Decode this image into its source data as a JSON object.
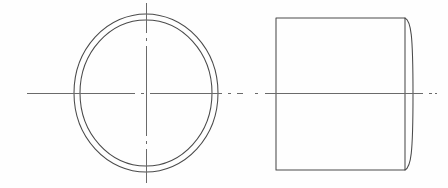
{
  "drawing": {
    "title": "Orthographic drawing of a cylindrical tube",
    "background_color": "#fefefe",
    "object_line_color": "#4a4a4a",
    "center_line_color": "#6a6a6a",
    "object_line_width": 1.05,
    "center_line_width": 1,
    "canvas": {
      "width": 448,
      "height": 188
    },
    "views": [
      {
        "name": "front-view",
        "label": "Front view (circular end face)",
        "type": "concentric-circles",
        "center": {
          "x": 146,
          "y": 93
        },
        "outer_circle": {
          "rx": 72,
          "ry": 79
        },
        "inner_circle": {
          "rx": 66,
          "ry": 73
        }
      },
      {
        "name": "side-view",
        "label": "Side view (cylinder profile)",
        "type": "rectangle-with-curved-edge",
        "left": 276,
        "right": 405,
        "top": 18,
        "bottom": 170,
        "curve_bulge_x": 413
      }
    ],
    "center_lines": [
      {
        "name": "front-view-horizontal-centerline",
        "orientation": "horizontal",
        "y": 93,
        "x_start": 27,
        "x_end": 243,
        "pattern": "dash-dot"
      },
      {
        "name": "front-view-vertical-centerline",
        "orientation": "vertical",
        "x": 146,
        "y_start": 3,
        "y_end": 185,
        "pattern": "dash-dot"
      },
      {
        "name": "side-view-horizontal-centerline",
        "orientation": "horizontal",
        "y": 93,
        "x_start": 255,
        "x_end": 437,
        "pattern": "dash-dot"
      }
    ],
    "dash_pattern": {
      "long": 26,
      "gap": 5,
      "dot": 3
    }
  },
  "chart_data": {
    "type": "table",
    "title": "Orthographic drawing of a cylindrical tube",
    "categories": [
      "front-view",
      "side-view"
    ],
    "values": [
      2,
      1
    ],
    "xlabel": "",
    "ylabel": "",
    "annotations": [
      "Front view: two concentric circles representing tube outer and inner diameter",
      "Side view: rectangle with rounded right-hand edge representing cylinder length",
      "Dash-dot centerlines mark the axis of revolution in both views"
    ]
  }
}
